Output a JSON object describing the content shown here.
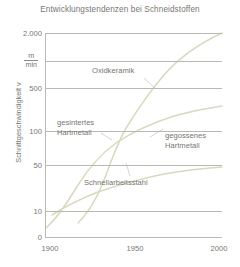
{
  "chart_data": {
    "type": "line",
    "title": "Entwicklungstendenzen bei Schneidstoffen",
    "xlabel": "",
    "ylabel": "Schnittgeschwindigkeit v",
    "yunit_numerator": "m",
    "yunit_denominator": "min",
    "yscale": "log",
    "xticks": [
      "1900",
      "1950",
      "2000"
    ],
    "xtick_values": [
      1900,
      1950,
      2000
    ],
    "xlim": [
      1900,
      2000
    ],
    "yticks": [
      "0",
      "10",
      "50",
      "100",
      "500",
      "2.000"
    ],
    "ytick_values": [
      0,
      10,
      50,
      100,
      500,
      2000
    ],
    "ylim": [
      10,
      2000
    ],
    "grid": true,
    "legend": "inline-annotations",
    "series": [
      {
        "name": "Oxidkeramik",
        "label": "Oxidkeramik",
        "x": [
          1918,
          1930,
          1940,
          1948,
          1955,
          1962,
          1970,
          1980,
          1990,
          2000
        ],
        "values": [
          13,
          24,
          45,
          80,
          160,
          320,
          560,
          900,
          1400,
          2000
        ]
      },
      {
        "name": "gesintertes Hartmetall",
        "label": "gesintertes Hartmetall",
        "x": [
          1900,
          1915,
          1928,
          1940,
          1950,
          1960,
          1972,
          1985,
          2000
        ],
        "values": [
          11,
          20,
          36,
          55,
          78,
          105,
          140,
          175,
          215
        ]
      },
      {
        "name": "gegossenes Hartmetall",
        "label": "gegossenes Hartmetall",
        "x": [
          1900,
          1915,
          1928,
          1940,
          1950,
          1960,
          1972,
          1985,
          2000
        ],
        "values": [
          11,
          20,
          36,
          55,
          78,
          105,
          140,
          175,
          215
        ]
      },
      {
        "name": "Schnellarbeitsstahl",
        "label": "Schnellarbeitsstahl",
        "x": [
          1905,
          1920,
          1935,
          1950,
          1962,
          1975,
          1988,
          2000
        ],
        "values": [
          17,
          23,
          29,
          36,
          42,
          47,
          51,
          54
        ]
      }
    ],
    "colors": {
      "curve": "#d8d8be",
      "grid": "#b9b9b4",
      "text": "#76766f",
      "background": "#ffffff"
    }
  }
}
